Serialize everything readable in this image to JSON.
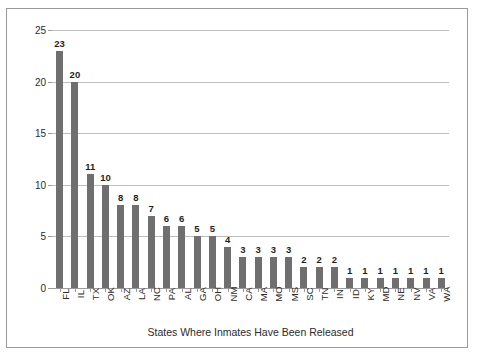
{
  "chart_data": {
    "type": "bar",
    "title": "",
    "xlabel": "States Where Inmates Have Been Released",
    "ylabel": "Number Released Since 1973",
    "categories": [
      "FL",
      "IL",
      "TX",
      "OK",
      "AZ",
      "LA",
      "NC",
      "PA",
      "AL",
      "GA",
      "OH",
      "NM",
      "CA",
      "MA",
      "MO",
      "MS",
      "SC",
      "TN",
      "IN",
      "ID",
      "KY",
      "MD",
      "NE",
      "NV",
      "VA",
      "WA"
    ],
    "values": [
      23,
      20,
      11,
      10,
      8,
      8,
      7,
      6,
      6,
      5,
      5,
      4,
      3,
      3,
      3,
      3,
      2,
      2,
      2,
      1,
      1,
      1,
      1,
      1,
      1,
      1
    ],
    "ylim": [
      0,
      25
    ],
    "yticks": [
      0,
      5,
      10,
      15,
      20,
      25
    ],
    "ytick_labels": [
      "0",
      "5",
      "10",
      "15",
      "20",
      "25"
    ],
    "grid": true,
    "legend": false,
    "data_labels": true,
    "bar_color": "#6f6f6f",
    "gridline_color": "#bdbdbd",
    "axis_color": "#9a9a9a",
    "frame_color": "#9a9a9a",
    "background": "#ffffff"
  }
}
